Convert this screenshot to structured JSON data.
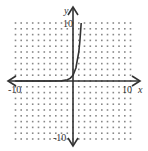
{
  "chart_data": {
    "type": "line",
    "title": "",
    "xlabel": "x",
    "ylabel": "y",
    "xlim": [
      -10,
      10
    ],
    "ylim": [
      -10,
      10
    ],
    "grid": "dots",
    "grid_step": 1,
    "tick_labels": {
      "x_min": "-10",
      "x_max": "10",
      "y_min": "-10",
      "y_max": "10"
    },
    "series": [
      {
        "name": "exponential curve",
        "description": "approximately y = 5^x; near 0 for x < 0, passes (0,1), reaches y = 10 near x ≈ 1.4",
        "x": [
          -10,
          -4,
          -2,
          -1,
          -0.5,
          0,
          0.5,
          1,
          1.2,
          1.43
        ],
        "values": [
          0,
          0.0016,
          0.04,
          0.2,
          0.45,
          1,
          2.24,
          5,
          6.9,
          10
        ]
      }
    ],
    "colors": {
      "curve": "#333333",
      "axes": "#333333",
      "grid_dots": "#888888"
    }
  }
}
